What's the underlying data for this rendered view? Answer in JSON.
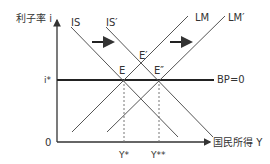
{
  "axes": {
    "y_label": "利子率 i",
    "x_label": "国民所得 Y",
    "origin": "0",
    "y_tick": "i*",
    "x_ticks": [
      "Y*",
      "Y**"
    ]
  },
  "curves": {
    "is": "IS",
    "is_shifted": "IS′",
    "lm": "LM",
    "lm_shifted": "LM′",
    "bp": "BP=0"
  },
  "points": {
    "e": "E",
    "e_prime": "E′",
    "e_double_prime": "E″"
  },
  "colors": {
    "line": "#555555",
    "axis": "#333333",
    "bp_line": "#222222",
    "text": "#333333"
  }
}
